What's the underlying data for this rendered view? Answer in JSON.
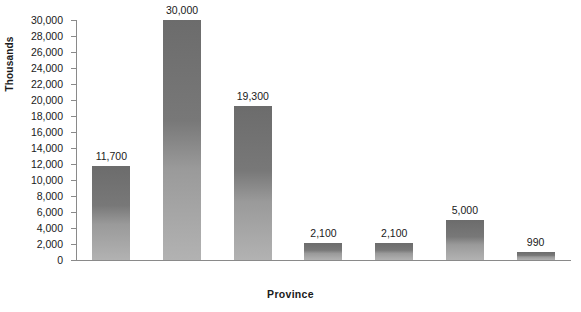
{
  "chart_data": {
    "type": "bar",
    "title": "",
    "xlabel": "Province",
    "ylabel": "Thousands",
    "categories": [
      "British Columbia",
      "Ontario",
      "Quebec",
      "Saskatchewan",
      "Manitoba",
      "Alberta",
      "Atlantic provinces"
    ],
    "category_lines": [
      [
        "British",
        "Columbia"
      ],
      [
        "Ontario",
        ""
      ],
      [
        "Quebec",
        ""
      ],
      [
        "Saskatchewan",
        ""
      ],
      [
        "Manitoba",
        ""
      ],
      [
        "Alberta",
        ""
      ],
      [
        "Atlantic",
        "provinces"
      ]
    ],
    "values": [
      11700,
      30000,
      19300,
      2100,
      2100,
      5000,
      990
    ],
    "value_labels": [
      "11,700",
      "30,000",
      "19,300",
      "2,100",
      "2,100",
      "5,000",
      "990"
    ],
    "ylim": [
      0,
      30000
    ],
    "ytick_step": 2000,
    "ytick_labels": [
      "0",
      "2,000",
      "4,000",
      "6,000",
      "8,000",
      "10,000",
      "12,000",
      "14,000",
      "16,000",
      "18,000",
      "20,000",
      "22,000",
      "24,000",
      "26,000",
      "28,000",
      "30,000"
    ],
    "ytick_values": [
      0,
      2000,
      4000,
      6000,
      8000,
      10000,
      12000,
      14000,
      16000,
      18000,
      20000,
      22000,
      24000,
      26000,
      28000,
      30000
    ],
    "grid": false,
    "legend": null,
    "bar_color_top": "#6c6c6c",
    "bar_color_bottom": "#b2b2b2",
    "axis_color": "#8a8a8a",
    "text_color": "#1a1a1a",
    "background": "#ffffff"
  }
}
